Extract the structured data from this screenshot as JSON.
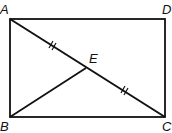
{
  "figure": {
    "type": "geometry-rectangle",
    "points": {
      "A": {
        "label": "A",
        "x": 10,
        "y": 19
      },
      "D": {
        "label": "D",
        "x": 165,
        "y": 19
      },
      "B": {
        "label": "B",
        "x": 10,
        "y": 117
      },
      "C": {
        "label": "C",
        "x": 165,
        "y": 117
      },
      "E": {
        "label": "E",
        "x": 86,
        "y": 68
      }
    },
    "segments": [
      "AD",
      "DC",
      "CB",
      "BA",
      "AC",
      "BE"
    ],
    "tick_marks": {
      "AE": 2,
      "EC": 2
    },
    "stroke_color": "#111111"
  }
}
